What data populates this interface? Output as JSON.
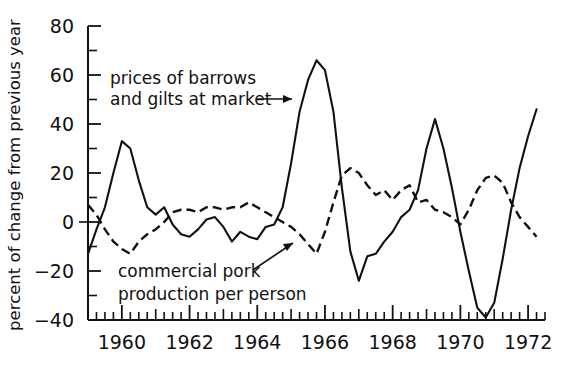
{
  "chart_data": {
    "type": "line",
    "title": "",
    "xlabel": "",
    "ylabel": "percent of change from previous year",
    "xlim": [
      1959.0,
      1972.5
    ],
    "ylim": [
      -40,
      80
    ],
    "grid": false,
    "legend_position": "inline-annotations",
    "y_ticks": [
      -40,
      -20,
      0,
      20,
      40,
      60,
      80
    ],
    "y_tick_labels": [
      "−40",
      "−20",
      "0",
      "20",
      "40",
      "60",
      "80"
    ],
    "y_minor_ticks": [
      -30,
      -10,
      10,
      30,
      50,
      70
    ],
    "x_ticks": [
      1960,
      1962,
      1964,
      1966,
      1968,
      1970,
      1972
    ],
    "x_tick_labels": [
      "1960",
      "1962",
      "1964",
      "1966",
      "1968",
      "1970",
      "1972"
    ],
    "x_minor_tick_interval_years": 0.25,
    "series": [
      {
        "name": "prices of barrows and gilts at market",
        "style": "solid",
        "x": [
          1959.0,
          1959.25,
          1959.5,
          1959.75,
          1960.0,
          1960.25,
          1960.5,
          1960.75,
          1961.0,
          1961.25,
          1961.5,
          1961.75,
          1962.0,
          1962.25,
          1962.5,
          1962.75,
          1963.0,
          1963.25,
          1963.5,
          1963.75,
          1964.0,
          1964.25,
          1964.5,
          1964.75,
          1965.0,
          1965.25,
          1965.5,
          1965.75,
          1966.0,
          1966.25,
          1966.5,
          1966.75,
          1967.0,
          1967.25,
          1967.5,
          1967.75,
          1968.0,
          1968.25,
          1968.5,
          1968.75,
          1969.0,
          1969.25,
          1969.5,
          1969.75,
          1970.0,
          1970.25,
          1970.5,
          1970.75,
          1971.0,
          1971.25,
          1971.5,
          1971.75,
          1972.0,
          1972.25
        ],
        "y": [
          -13,
          -3,
          6,
          20,
          33,
          30,
          17,
          6,
          3,
          6,
          -1,
          -5,
          -6,
          -3,
          1,
          2,
          -2,
          -8,
          -4,
          -6,
          -7,
          -2,
          -1,
          6,
          24,
          45,
          58,
          66,
          62,
          45,
          14,
          -12,
          -24,
          -14,
          -13,
          -8,
          -4,
          2,
          5,
          13,
          30,
          42,
          30,
          14,
          -4,
          -20,
          -35,
          -39,
          -33,
          -15,
          5,
          22,
          35,
          46
        ],
        "peaks": [
          {
            "x": 1960.0,
            "y": 33,
            "label": "1960 price peak"
          },
          {
            "x": 1965.75,
            "y": 66,
            "label": "1965 price peak"
          },
          {
            "x": 1969.25,
            "y": 42,
            "label": "1969 price peak"
          },
          {
            "x": 1972.25,
            "y": 46,
            "label": "1972 price rise"
          }
        ],
        "troughs": [
          {
            "x": 1967.0,
            "y": -24,
            "label": "1967 price trough"
          },
          {
            "x": 1970.75,
            "y": -39,
            "label": "1970-71 price trough"
          }
        ]
      },
      {
        "name": "commercial pork production per person",
        "style": "dashed",
        "x": [
          1959.0,
          1959.25,
          1959.5,
          1959.75,
          1960.0,
          1960.25,
          1960.5,
          1960.75,
          1961.0,
          1961.25,
          1961.5,
          1961.75,
          1962.0,
          1962.25,
          1962.5,
          1962.75,
          1963.0,
          1963.25,
          1963.5,
          1963.75,
          1964.0,
          1964.25,
          1964.5,
          1964.75,
          1965.0,
          1965.25,
          1965.5,
          1965.75,
          1966.0,
          1966.25,
          1966.5,
          1966.75,
          1967.0,
          1967.25,
          1967.5,
          1967.75,
          1968.0,
          1968.25,
          1968.5,
          1968.75,
          1969.0,
          1969.25,
          1969.5,
          1969.75,
          1970.0,
          1970.25,
          1970.5,
          1970.75,
          1971.0,
          1971.25,
          1971.5,
          1971.75,
          1972.0,
          1972.25
        ],
        "y": [
          7,
          3,
          -3,
          -8,
          -11,
          -13,
          -8,
          -5,
          -3,
          0,
          4,
          5,
          5,
          4,
          6,
          6,
          5,
          6,
          6,
          8,
          6,
          4,
          2,
          0,
          -2,
          -5,
          -9,
          -13,
          -4,
          8,
          19,
          22,
          20,
          15,
          11,
          13,
          9,
          13,
          15,
          8,
          9,
          5,
          4,
          2,
          -1,
          5,
          13,
          18,
          19,
          16,
          8,
          2,
          -2,
          -6
        ],
        "peaks": [
          {
            "x": 1966.75,
            "y": 22,
            "label": "1966 production peak"
          },
          {
            "x": 1971.0,
            "y": 19,
            "label": "1971 production peak"
          }
        ],
        "troughs": [
          {
            "x": 1960.25,
            "y": -13,
            "label": "1960 production trough"
          },
          {
            "x": 1965.75,
            "y": -13,
            "label": "1965 production trough"
          }
        ]
      }
    ],
    "annotations": [
      {
        "id": "prices-annotation",
        "text_line_1": "prices of barrows",
        "text_line_2": "and gilts at market",
        "points_to_series": "prices of barrows and gilts at market"
      },
      {
        "id": "production-annotation",
        "text_line_1": "commercial pork",
        "text_line_2": "production per person",
        "points_to_series": "commercial pork production per person"
      }
    ]
  },
  "colors": {
    "ink": "#111111",
    "background": "#ffffff"
  }
}
